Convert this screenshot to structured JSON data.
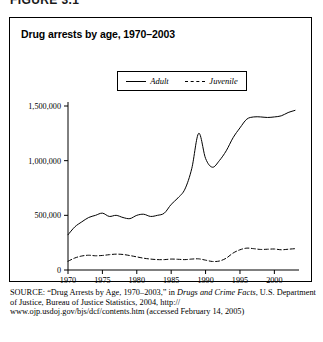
{
  "figure": {
    "heading": "FIGURE 3.1",
    "title": "Drug arrests by age, 1970–2003"
  },
  "legend": {
    "position": "top-center",
    "entries": [
      {
        "label": "Adult",
        "style": "solid",
        "icon": "solid-line-icon"
      },
      {
        "label": "Juvenile",
        "style": "dashed",
        "icon": "dashed-line-icon"
      }
    ]
  },
  "source": {
    "label": "SOURCE:",
    "line1_quoted": "“Drug Arrests by Age, 1970–2003,” in ",
    "line1_italic": "Drugs and Crime Facts",
    "line1_tail": ",",
    "line2": "U.S. Department of Justice, Bureau of Justice Statistics, 2004, http://",
    "line3": "www.ojp.usdoj.gov/bjs/dcf/contents.htm (accessed February 14, 2005)"
  },
  "chart_data": {
    "type": "line",
    "title": "Drug arrests by age, 1970–2003",
    "xlabel": "",
    "ylabel": "",
    "xlim": [
      1970,
      2003
    ],
    "ylim": [
      0,
      1500000
    ],
    "grid": false,
    "legend_position": "top-center",
    "xticks": [
      1970,
      1975,
      1980,
      1985,
      1990,
      1995,
      2000
    ],
    "xtick_labels": [
      "1970",
      "1975",
      "1980",
      "1985",
      "1990",
      "1995",
      "2000"
    ],
    "yticks": [
      0,
      500000,
      1000000,
      1500000
    ],
    "ytick_labels": [
      "0",
      "500,000",
      "1,000,000",
      "1,500,000"
    ],
    "x": [
      1970,
      1971,
      1972,
      1973,
      1974,
      1975,
      1976,
      1977,
      1978,
      1979,
      1980,
      1981,
      1982,
      1983,
      1984,
      1985,
      1986,
      1987,
      1988,
      1989,
      1990,
      1991,
      1992,
      1993,
      1994,
      1995,
      1996,
      1997,
      1998,
      1999,
      2000,
      2001,
      2002,
      2003
    ],
    "series": [
      {
        "name": "Adult",
        "style": "solid",
        "values": [
          322000,
          395000,
          440000,
          480000,
          500000,
          520000,
          490000,
          500000,
          480000,
          470000,
          500000,
          510000,
          490000,
          500000,
          520000,
          600000,
          660000,
          740000,
          930000,
          1250000,
          1020000,
          940000,
          1000000,
          1090000,
          1210000,
          1300000,
          1380000,
          1400000,
          1400000,
          1395000,
          1400000,
          1410000,
          1440000,
          1460000
        ]
      },
      {
        "name": "Juvenile",
        "style": "dashed",
        "values": [
          80000,
          110000,
          128000,
          135000,
          130000,
          133000,
          140000,
          145000,
          142000,
          132000,
          120000,
          108000,
          100000,
          95000,
          95000,
          100000,
          98000,
          95000,
          100000,
          102000,
          90000,
          78000,
          82000,
          108000,
          155000,
          185000,
          200000,
          195000,
          188000,
          190000,
          192000,
          185000,
          190000,
          195000
        ]
      }
    ]
  }
}
